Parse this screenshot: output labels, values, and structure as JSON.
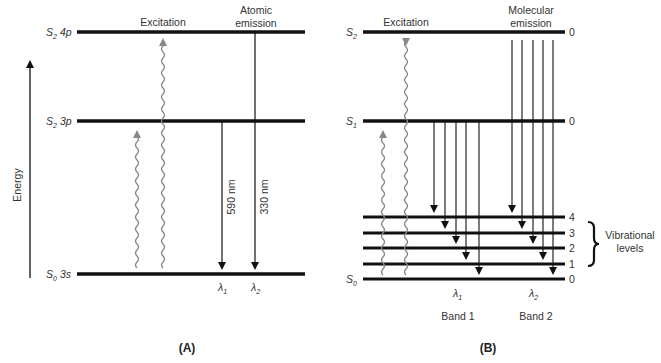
{
  "panel_a": {
    "caption": "(A)",
    "axis_label": "Energy",
    "levels": [
      {
        "state": "S",
        "sub": "2",
        "orbital": "4p"
      },
      {
        "state": "S",
        "sub": "2",
        "orbital": "3p"
      },
      {
        "state": "S",
        "sub": "0",
        "orbital": "3s"
      }
    ],
    "excitation_label": "Excitation",
    "emission_label_line1": "Atomic",
    "emission_label_line2": "emission",
    "emissions": [
      {
        "wavelength": "590 nm",
        "lambda": "λ",
        "lambda_sub": "1"
      },
      {
        "wavelength": "330 nm",
        "lambda": "λ",
        "lambda_sub": "2"
      }
    ]
  },
  "panel_b": {
    "caption": "(B)",
    "levels": [
      {
        "state": "S",
        "sub": "2",
        "vib": "0"
      },
      {
        "state": "S",
        "sub": "1",
        "vib": "0"
      },
      {
        "state": "S",
        "sub": "0"
      }
    ],
    "vibrational_numbers": [
      "4",
      "3",
      "2",
      "1",
      "0"
    ],
    "vibrational_label_line1": "Vibrational",
    "vibrational_label_line2": "levels",
    "excitation_label": "Excitation",
    "emission_label_line1": "Molecular",
    "emission_label_line2": "emission",
    "bands": [
      {
        "name": "Band 1",
        "lambda": "λ",
        "lambda_sub": "1"
      },
      {
        "name": "Band 2",
        "lambda": "λ",
        "lambda_sub": "2"
      }
    ]
  },
  "colors": {
    "line": "#111111",
    "wavy": "#888888"
  }
}
